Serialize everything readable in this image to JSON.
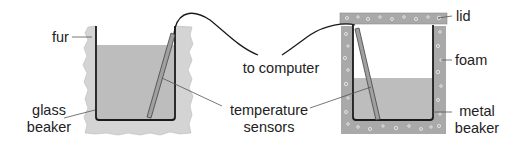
{
  "diagram": {
    "left_setup": {
      "insulation_label": "fur",
      "container_label_line1": "glass",
      "container_label_line2": "beaker"
    },
    "right_setup": {
      "lid_label": "lid",
      "insulation_label": "foam",
      "container_label_line1": "metal",
      "container_label_line2": "beaker"
    },
    "shared": {
      "cable_label": "to computer",
      "sensor_label_line1": "temperature",
      "sensor_label_line2": "sensors"
    },
    "colors": {
      "fur": "#d4d4d4",
      "water": "#bdbdbd",
      "foam": "#a9a9a9",
      "wall": "#1a1a1a",
      "leader": "#555555",
      "sensor": "#9a9a9a"
    }
  }
}
